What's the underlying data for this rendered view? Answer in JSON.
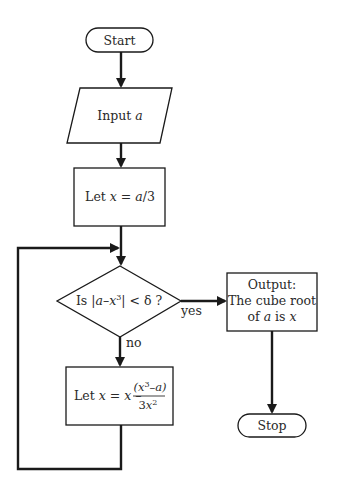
{
  "diagram": {
    "type": "flowchart",
    "nodes": {
      "start": {
        "shape": "terminator",
        "label": "Start"
      },
      "input": {
        "shape": "parallelogram",
        "label_prefix": "Input ",
        "label_var": "a"
      },
      "init": {
        "shape": "process",
        "label_prefix": "Let ",
        "label_var": "x",
        "label_eq": " = ",
        "label_rhs_var": "a",
        "label_rhs": "/3"
      },
      "decision": {
        "shape": "decision",
        "label_prefix": "Is |",
        "label_a": "a",
        "label_minus": "–",
        "label_x": "x",
        "label_exp": "3",
        "label_suffix": "| < δ ?"
      },
      "update": {
        "shape": "process",
        "label_prefix": "Let ",
        "label_x1": "x",
        "label_eq": " = ",
        "label_x2": "x",
        "label_minus": " – ",
        "numerator_open": "(",
        "numerator_x": "x",
        "numerator_exp": "3",
        "numerator_minus": "–",
        "numerator_a": "a",
        "numerator_close": ")",
        "denominator_coef": "3",
        "denominator_x": "x",
        "denominator_exp": "2"
      },
      "output": {
        "shape": "process",
        "line1": "Output:",
        "line2": "The cube root",
        "line3_prefix": "of ",
        "line3_a": "a",
        "line3_mid": " is ",
        "line3_x": "x"
      },
      "stop": {
        "shape": "terminator",
        "label": "Stop"
      }
    },
    "edges": [
      {
        "from": "start",
        "to": "input"
      },
      {
        "from": "input",
        "to": "init"
      },
      {
        "from": "init",
        "to": "decision"
      },
      {
        "from": "decision",
        "to": "output",
        "label": "yes"
      },
      {
        "from": "decision",
        "to": "update",
        "label": "no"
      },
      {
        "from": "update",
        "to": "decision",
        "label": ""
      },
      {
        "from": "output",
        "to": "stop"
      }
    ],
    "edge_labels": {
      "yes": "yes",
      "no": "no"
    },
    "colors": {
      "stroke": "#1a1a1a",
      "fill": "#ffffff",
      "text": "#2a2a2a"
    }
  }
}
